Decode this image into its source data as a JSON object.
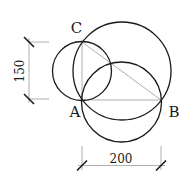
{
  "diagram": {
    "type": "geometry-construction",
    "points": {
      "A": {
        "label": "A"
      },
      "B": {
        "label": "B"
      },
      "C": {
        "label": "C"
      }
    },
    "dimensions": {
      "vertical": {
        "label": "150"
      },
      "horizontal": {
        "label": "200"
      }
    },
    "circles": [
      {
        "name": "circle-diameter-AC"
      },
      {
        "name": "circle-diameter-AB"
      },
      {
        "name": "circle-diameter-BC"
      }
    ],
    "segments": [
      "AB",
      "AC",
      "BC"
    ]
  }
}
